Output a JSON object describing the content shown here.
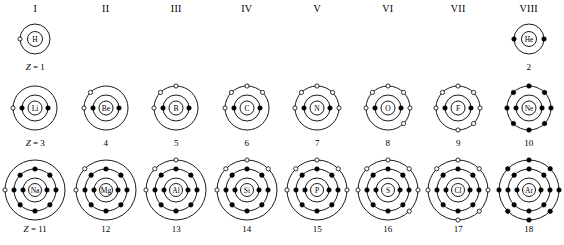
{
  "diagram": {
    "type": "atomic-shell-table",
    "colors": {
      "stroke": "#000000",
      "filled_electron": "#000000",
      "open_electron": "#ffffff",
      "background": "#ffffff"
    },
    "legend": {
      "filled_dot_meaning": "paired electron",
      "open_circle_meaning": "unpaired electron"
    }
  },
  "columns": [
    {
      "label": "I"
    },
    {
      "label": "II"
    },
    {
      "label": "III"
    },
    {
      "label": "IV"
    },
    {
      "label": "V"
    },
    {
      "label": "VI"
    },
    {
      "label": "VII"
    },
    {
      "label": "VIII"
    }
  ],
  "periods": [
    {
      "index": 1,
      "z_prefix": "Z = ",
      "elements": [
        {
          "symbol": "H",
          "z": 1,
          "z_label": "Z = 1",
          "z_prefixed": true,
          "group": "I",
          "shells": [
            {
              "radius": 15,
              "open": 1,
              "filled": 0,
              "angles_open": [
                180
              ],
              "angles_filled": []
            }
          ],
          "nucleus_radius": 7.5
        },
        null,
        null,
        null,
        null,
        null,
        null,
        {
          "symbol": "He",
          "z": 2,
          "z_label": "2",
          "z_prefixed": false,
          "group": "VIII",
          "shells": [
            {
              "radius": 15,
              "open": 0,
              "filled": 2,
              "angles_open": [],
              "angles_filled": [
                180,
                0
              ]
            }
          ],
          "nucleus_radius": 7.5
        }
      ]
    },
    {
      "index": 2,
      "z_prefix": "Z = ",
      "elements": [
        {
          "symbol": "Li",
          "z": 3,
          "z_label": "Z = 3",
          "z_prefixed": true,
          "group": "I",
          "shells": [
            {
              "radius": 13,
              "open": 0,
              "filled": 2,
              "angles_open": [],
              "angles_filled": [
                180,
                0
              ]
            },
            {
              "radius": 22,
              "open": 1,
              "filled": 0,
              "angles_open": [
                180
              ],
              "angles_filled": []
            }
          ],
          "nucleus_radius": 7
        },
        {
          "symbol": "Be",
          "z": 4,
          "z_label": "4",
          "z_prefixed": false,
          "group": "II",
          "shells": [
            {
              "radius": 13,
              "open": 0,
              "filled": 2,
              "angles_open": [],
              "angles_filled": [
                180,
                0
              ]
            },
            {
              "radius": 22,
              "open": 2,
              "filled": 0,
              "angles_open": [
                180,
                135
              ],
              "angles_filled": []
            }
          ],
          "nucleus_radius": 7
        },
        {
          "symbol": "B",
          "z": 5,
          "z_label": "5",
          "z_prefixed": false,
          "group": "III",
          "shells": [
            {
              "radius": 13,
              "open": 0,
              "filled": 2,
              "angles_open": [],
              "angles_filled": [
                180,
                0
              ]
            },
            {
              "radius": 22,
              "open": 3,
              "filled": 0,
              "angles_open": [
                180,
                135,
                90
              ],
              "angles_filled": []
            }
          ],
          "nucleus_radius": 7
        },
        {
          "symbol": "C",
          "z": 6,
          "z_label": "6",
          "z_prefixed": false,
          "group": "IV",
          "shells": [
            {
              "radius": 13,
              "open": 0,
              "filled": 2,
              "angles_open": [],
              "angles_filled": [
                180,
                0
              ]
            },
            {
              "radius": 22,
              "open": 4,
              "filled": 0,
              "angles_open": [
                180,
                135,
                90,
                45
              ],
              "angles_filled": []
            }
          ],
          "nucleus_radius": 7
        },
        {
          "symbol": "N",
          "z": 7,
          "z_label": "7",
          "z_prefixed": false,
          "group": "V",
          "shells": [
            {
              "radius": 13,
              "open": 0,
              "filled": 2,
              "angles_open": [],
              "angles_filled": [
                180,
                0
              ]
            },
            {
              "radius": 22,
              "open": 5,
              "filled": 0,
              "angles_open": [
                180,
                135,
                90,
                45,
                0
              ],
              "angles_filled": []
            }
          ],
          "nucleus_radius": 7
        },
        {
          "symbol": "O",
          "z": 8,
          "z_label": "8",
          "z_prefixed": false,
          "group": "VI",
          "shells": [
            {
              "radius": 13,
              "open": 0,
              "filled": 2,
              "angles_open": [],
              "angles_filled": [
                180,
                0
              ]
            },
            {
              "radius": 22,
              "open": 6,
              "filled": 0,
              "angles_open": [
                180,
                135,
                90,
                45,
                0,
                315
              ],
              "angles_filled": []
            }
          ],
          "nucleus_radius": 7
        },
        {
          "symbol": "F",
          "z": 9,
          "z_label": "9",
          "z_prefixed": false,
          "group": "VII",
          "shells": [
            {
              "radius": 13,
              "open": 0,
              "filled": 2,
              "angles_open": [],
              "angles_filled": [
                180,
                0
              ]
            },
            {
              "radius": 22,
              "open": 7,
              "filled": 0,
              "angles_open": [
                180,
                135,
                90,
                45,
                0,
                315,
                270
              ],
              "angles_filled": []
            }
          ],
          "nucleus_radius": 7
        },
        {
          "symbol": "Ne",
          "z": 10,
          "z_label": "10",
          "z_prefixed": false,
          "group": "VIII",
          "shells": [
            {
              "radius": 13,
              "open": 0,
              "filled": 2,
              "angles_open": [],
              "angles_filled": [
                180,
                0
              ]
            },
            {
              "radius": 22,
              "open": 0,
              "filled": 8,
              "angles_open": [],
              "angles_filled": [
                180,
                135,
                90,
                45,
                0,
                315,
                270,
                225
              ]
            }
          ],
          "nucleus_radius": 7
        }
      ]
    },
    {
      "index": 3,
      "z_prefix": "Z = ",
      "elements": [
        {
          "symbol": "Na",
          "z": 11,
          "z_label": "Z = 11",
          "z_prefixed": true,
          "group": "I",
          "shells": [
            {
              "radius": 12,
              "open": 0,
              "filled": 2,
              "angles_open": [],
              "angles_filled": [
                180,
                0
              ]
            },
            {
              "radius": 21,
              "open": 0,
              "filled": 8,
              "angles_open": [],
              "angles_filled": [
                180,
                135,
                90,
                45,
                0,
                315,
                270,
                225
              ]
            },
            {
              "radius": 30,
              "open": 1,
              "filled": 0,
              "angles_open": [
                180
              ],
              "angles_filled": []
            }
          ],
          "nucleus_radius": 6.5
        },
        {
          "symbol": "Mg",
          "z": 12,
          "z_label": "12",
          "z_prefixed": false,
          "group": "II",
          "shells": [
            {
              "radius": 12,
              "open": 0,
              "filled": 2,
              "angles_open": [],
              "angles_filled": [
                180,
                0
              ]
            },
            {
              "radius": 21,
              "open": 0,
              "filled": 8,
              "angles_open": [],
              "angles_filled": [
                180,
                135,
                90,
                45,
                0,
                315,
                270,
                225
              ]
            },
            {
              "radius": 30,
              "open": 2,
              "filled": 0,
              "angles_open": [
                180,
                135
              ],
              "angles_filled": []
            }
          ],
          "nucleus_radius": 6.5
        },
        {
          "symbol": "Al",
          "z": 13,
          "z_label": "13",
          "z_prefixed": false,
          "group": "III",
          "shells": [
            {
              "radius": 12,
              "open": 0,
              "filled": 2,
              "angles_open": [],
              "angles_filled": [
                180,
                0
              ]
            },
            {
              "radius": 21,
              "open": 0,
              "filled": 8,
              "angles_open": [],
              "angles_filled": [
                180,
                135,
                90,
                45,
                0,
                315,
                270,
                225
              ]
            },
            {
              "radius": 30,
              "open": 3,
              "filled": 0,
              "angles_open": [
                180,
                135,
                90
              ],
              "angles_filled": []
            }
          ],
          "nucleus_radius": 6.5
        },
        {
          "symbol": "Si",
          "z": 14,
          "z_label": "14",
          "z_prefixed": false,
          "group": "IV",
          "shells": [
            {
              "radius": 12,
              "open": 0,
              "filled": 2,
              "angles_open": [],
              "angles_filled": [
                180,
                0
              ]
            },
            {
              "radius": 21,
              "open": 0,
              "filled": 8,
              "angles_open": [],
              "angles_filled": [
                180,
                135,
                90,
                45,
                0,
                315,
                270,
                225
              ]
            },
            {
              "radius": 30,
              "open": 4,
              "filled": 0,
              "angles_open": [
                180,
                135,
                90,
                45
              ],
              "angles_filled": []
            }
          ],
          "nucleus_radius": 6.5
        },
        {
          "symbol": "P",
          "z": 15,
          "z_label": "15",
          "z_prefixed": false,
          "group": "V",
          "shells": [
            {
              "radius": 12,
              "open": 0,
              "filled": 2,
              "angles_open": [],
              "angles_filled": [
                180,
                0
              ]
            },
            {
              "radius": 21,
              "open": 0,
              "filled": 8,
              "angles_open": [],
              "angles_filled": [
                180,
                135,
                90,
                45,
                0,
                315,
                270,
                225
              ]
            },
            {
              "radius": 30,
              "open": 5,
              "filled": 0,
              "angles_open": [
                180,
                135,
                90,
                45,
                0
              ],
              "angles_filled": []
            }
          ],
          "nucleus_radius": 6.5
        },
        {
          "symbol": "S",
          "z": 16,
          "z_label": "16",
          "z_prefixed": false,
          "group": "VI",
          "shells": [
            {
              "radius": 12,
              "open": 0,
              "filled": 2,
              "angles_open": [],
              "angles_filled": [
                180,
                0
              ]
            },
            {
              "radius": 21,
              "open": 0,
              "filled": 8,
              "angles_open": [],
              "angles_filled": [
                180,
                135,
                90,
                45,
                0,
                315,
                270,
                225
              ]
            },
            {
              "radius": 30,
              "open": 6,
              "filled": 0,
              "angles_open": [
                180,
                135,
                90,
                45,
                0,
                315
              ],
              "angles_filled": []
            }
          ],
          "nucleus_radius": 6.5
        },
        {
          "symbol": "Cl",
          "z": 17,
          "z_label": "17",
          "z_prefixed": false,
          "group": "VII",
          "shells": [
            {
              "radius": 12,
              "open": 0,
              "filled": 2,
              "angles_open": [],
              "angles_filled": [
                180,
                0
              ]
            },
            {
              "radius": 21,
              "open": 0,
              "filled": 8,
              "angles_open": [],
              "angles_filled": [
                180,
                135,
                90,
                45,
                0,
                315,
                270,
                225
              ]
            },
            {
              "radius": 30,
              "open": 7,
              "filled": 0,
              "angles_open": [
                180,
                135,
                90,
                45,
                0,
                315,
                270
              ],
              "angles_filled": []
            }
          ],
          "nucleus_radius": 6.5
        },
        {
          "symbol": "Ar",
          "z": 18,
          "z_label": "18",
          "z_prefixed": false,
          "group": "VIII",
          "shells": [
            {
              "radius": 12,
              "open": 0,
              "filled": 2,
              "angles_open": [],
              "angles_filled": [
                180,
                0
              ]
            },
            {
              "radius": 21,
              "open": 0,
              "filled": 8,
              "angles_open": [],
              "angles_filled": [
                180,
                135,
                90,
                45,
                0,
                315,
                270,
                225
              ]
            },
            {
              "radius": 30,
              "open": 0,
              "filled": 8,
              "angles_open": [],
              "angles_filled": [
                180,
                135,
                90,
                45,
                0,
                315,
                270,
                225
              ]
            }
          ],
          "nucleus_radius": 6.5
        }
      ]
    }
  ]
}
